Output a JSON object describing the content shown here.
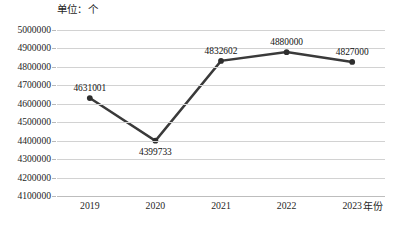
{
  "unit_label": "单位：个",
  "axis": {
    "x_title": "年份",
    "y_ticks": [
      "5000000",
      "4900000",
      "4800000",
      "4700000",
      "4600000",
      "4500000",
      "4400000",
      "4300000",
      "4200000",
      "4100000"
    ],
    "x_ticks": [
      "2019",
      "2020",
      "2021",
      "2022",
      "2023"
    ]
  },
  "point_labels": [
    "4631001",
    "4399733",
    "4832602",
    "4880000",
    "4827000"
  ],
  "colors": {
    "line": "#3a3a3a",
    "marker": "#2e2e2e",
    "gridline": "#d2d2d2",
    "baseline": "#bdbdbd",
    "text": "#1f1f1f",
    "background": "#ffffff"
  },
  "chart_data": {
    "type": "line",
    "title": "",
    "subtitle": "",
    "unit": "个",
    "xlabel": "年份",
    "ylabel": "",
    "categories": [
      "2019",
      "2020",
      "2021",
      "2022",
      "2023"
    ],
    "values": [
      4631001,
      4399733,
      4832602,
      4880000,
      4827000
    ],
    "data_labels": [
      "4631001",
      "4399733",
      "4832602",
      "4880000",
      "4827000"
    ],
    "data_label_positions": [
      "above",
      "below",
      "above",
      "above",
      "above"
    ],
    "ylim": [
      4100000,
      5000000
    ],
    "ytick_step": 100000,
    "ytick_values": [
      4100000,
      4200000,
      4300000,
      4400000,
      4500000,
      4600000,
      4700000,
      4800000,
      4900000,
      5000000
    ],
    "grid": "horizontal",
    "legend": "none",
    "markers": true,
    "line_width_px": 2.5
  }
}
